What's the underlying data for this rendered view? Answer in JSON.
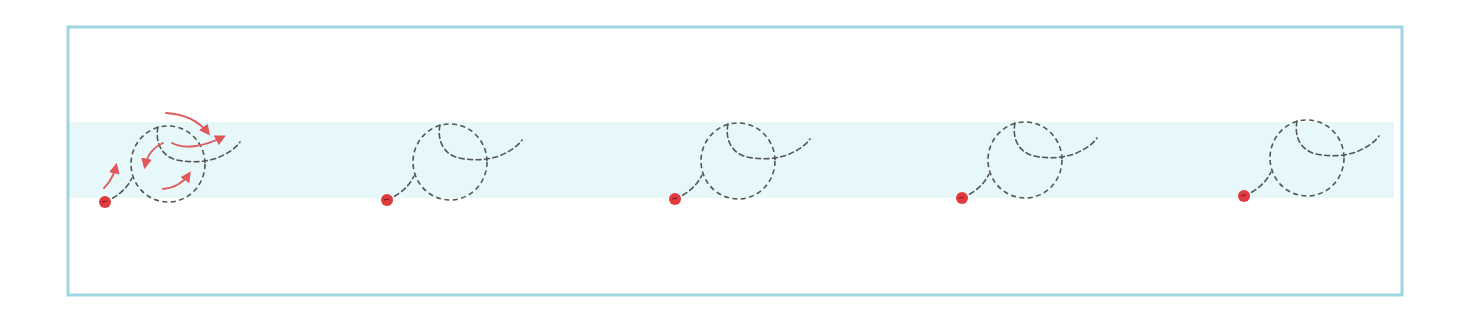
{
  "diagram": {
    "type": "motion-path-sequence",
    "colors": {
      "frame_border": "#9fd4e1",
      "band_fill": "#e6f8fa",
      "path_stroke": "#555555",
      "start_dot": "#e0393e",
      "arrow": "#e0585a",
      "background": "#ffffff"
    },
    "frame": {
      "x": 68,
      "y": 27,
      "width": 1334,
      "height": 268
    },
    "band": {
      "x": 69,
      "y": 122,
      "width": 1325,
      "height": 76
    },
    "figures": [
      {
        "id": 1,
        "dot_x": 105,
        "dot_y": 202,
        "annotated": true
      },
      {
        "id": 2,
        "dot_x": 387,
        "dot_y": 200,
        "annotated": false
      },
      {
        "id": 3,
        "dot_x": 675,
        "dot_y": 199,
        "annotated": false
      },
      {
        "id": 4,
        "dot_x": 962,
        "dot_y": 198,
        "annotated": false
      },
      {
        "id": 5,
        "dot_x": 1244,
        "dot_y": 196,
        "annotated": false
      }
    ],
    "direction_arrows": [
      {
        "label": "start-up",
        "path": "M104,188 C110,182 114,175 116,166"
      },
      {
        "label": "over-top",
        "path": "M166,113 C182,114 198,120 208,133"
      },
      {
        "label": "exit-right",
        "path": "M172,143 C185,150 205,146 223,137"
      },
      {
        "label": "inner-left",
        "path": "M163,143 C152,148 147,156 145,166"
      },
      {
        "label": "bottom-up",
        "path": "M163,189 C174,188 183,183 189,174"
      }
    ]
  }
}
